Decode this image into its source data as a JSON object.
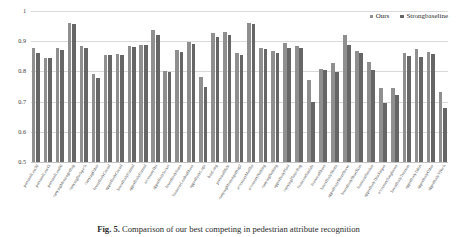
{
  "legend": {
    "position": "top-right",
    "items": [
      {
        "label": "Ours",
        "color": "#8f8f8f",
        "marker": "square"
      },
      {
        "label": "Strongbaseline",
        "color": "#666666",
        "marker": "square"
      }
    ]
  },
  "caption": {
    "figure_number": "Fig. 5.",
    "text": "Comparison of our best competing in pedestrian attribute recognition"
  },
  "chart_data": {
    "type": "bar",
    "title": "",
    "xlabel": "",
    "ylabel": "",
    "ylim": [
      0.5,
      1.0
    ],
    "ytick_labels": [
      "1",
      "0.9",
      "0.8",
      "0.7",
      "0.6",
      "0.5"
    ],
    "yticks": [
      1.0,
      0.9,
      0.8,
      0.7,
      0.6,
      0.5
    ],
    "grid": true,
    "legend_position": "top-right",
    "categories": [
      "personalLess30",
      "personalLess45",
      "personalLess60",
      "carryingMessengerBag",
      "carryingBackpack",
      "carryingOther",
      "lowerBodyCasual",
      "upperBodyCasual",
      "lowerBodyFormal",
      "upperBodyFormal",
      "accessoryHat",
      "upperBodyJacket",
      "lowerBodyJeans",
      "footwearLeatherShoes",
      "upperBodyLogo",
      "hairLong",
      "personalMale",
      "carryingMessengerBag2",
      "accessoryMuffler",
      "accessoryNothing",
      "carryingNothing",
      "upperBodyPlaid",
      "carryingPlasticBag",
      "footwearSandals",
      "footwearShoes",
      "lowerBodyShorts",
      "upperBodyShortSleeve",
      "lowerBodyShortSkirt",
      "footwearSneaker",
      "upperBodyThinStripes",
      "accessorySunglasses",
      "lowerBodyTrousers",
      "upperBodyTshirt",
      "upperBodyOther",
      "upperBodyVNeck"
    ],
    "series": [
      {
        "name": "Ours",
        "color": "#8f8f8f",
        "values": [
          0.876,
          0.846,
          0.879,
          0.96,
          0.884,
          0.791,
          0.856,
          0.858,
          0.883,
          0.888,
          0.938,
          0.8,
          0.871,
          0.896,
          0.783,
          0.926,
          0.93,
          0.862,
          0.96,
          0.877,
          0.869,
          0.895,
          0.885,
          0.77,
          0.808,
          0.829,
          0.92,
          0.866,
          0.83,
          0.746,
          0.745,
          0.861,
          0.874,
          0.864,
          0.731
        ]
      },
      {
        "name": "Strongbaseline",
        "color": "#666666",
        "values": [
          0.86,
          0.845,
          0.871,
          0.958,
          0.878,
          0.777,
          0.853,
          0.855,
          0.881,
          0.888,
          0.92,
          0.798,
          0.864,
          0.89,
          0.748,
          0.914,
          0.919,
          0.853,
          0.958,
          0.874,
          0.861,
          0.879,
          0.876,
          0.7,
          0.806,
          0.797,
          0.889,
          0.86,
          0.806,
          0.694,
          0.722,
          0.851,
          0.849,
          0.857,
          0.68
        ]
      }
    ]
  }
}
